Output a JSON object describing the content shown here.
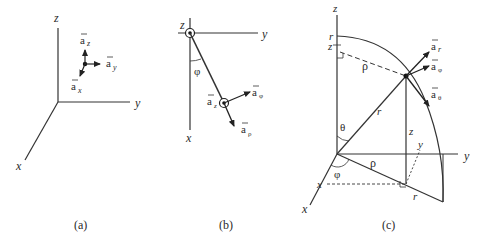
{
  "panels": [
    {
      "caption": "(a)",
      "title": "Rectangular coordinates",
      "axes": {
        "x": "x",
        "y": "y",
        "z": "z"
      },
      "unit_vectors": {
        "x": "a",
        "x_sub": "x",
        "y": "a",
        "y_sub": "y",
        "z": "a",
        "z_sub": "z"
      }
    },
    {
      "caption": "(b)",
      "title": "Cylindrical coordinates (top view)",
      "axes": {
        "x": "x",
        "y": "y",
        "z": "z"
      },
      "angle": "φ",
      "unit_vectors": {
        "rho": "a",
        "rho_sub": "ρ",
        "phi": "a",
        "phi_sub": "φ",
        "z": "a",
        "z_sub": "z"
      }
    },
    {
      "caption": "(c)",
      "title": "Spherical coordinates",
      "axes": {
        "x": "x",
        "y": "y",
        "z": "z"
      },
      "labels": {
        "r_top": "r",
        "z_top": "z",
        "rho_top": "ρ",
        "r_mid": "r",
        "z_mid": "z",
        "theta": "θ",
        "phi": "φ",
        "rho_ground": "ρ",
        "x_proj": "x",
        "y_proj": "y",
        "r_ground": "r"
      },
      "unit_vectors": {
        "r": "a",
        "r_sub": "r",
        "phi": "a",
        "phi_sub": "φ",
        "theta": "a",
        "theta_sub": "θ"
      }
    }
  ]
}
